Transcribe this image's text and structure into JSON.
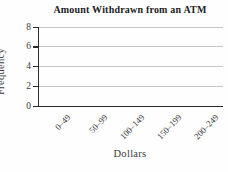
{
  "figure": {
    "background": "#fefefe"
  },
  "chart_data": {
    "type": "bar",
    "title": "Amount Withdrawn from an ATM",
    "xlabel": "Dollars",
    "ylabel": "Frequency",
    "categories": [
      "0–49",
      "50–99",
      "100–149",
      "150–199",
      "200–249"
    ],
    "values": [
      0,
      0,
      0,
      0,
      0
    ],
    "ylim": [
      0,
      8
    ],
    "yticks": [
      0,
      2,
      4,
      6,
      8
    ],
    "grid": "horizontal-light-gray-at-2-4-6-8",
    "legend": "none",
    "plot_is_empty_axes_only": true
  },
  "colors": {
    "axis": "#2a2a2a",
    "gridline": "#c6c6c6",
    "title_text": "#1c1c1c",
    "tick_text": "#3b3b3b",
    "background": "#fefefe"
  }
}
